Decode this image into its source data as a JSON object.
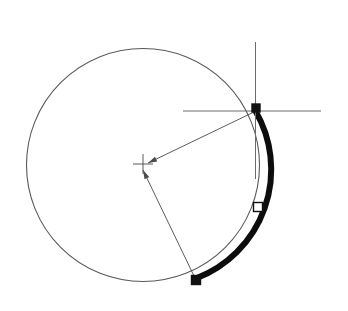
{
  "document": {
    "title": "CAD Arc Selection Diagram",
    "background_color": "#ffffff",
    "width": 348,
    "height": 311
  },
  "style": {
    "geometry_color": "#595959",
    "selection_color": "#0d0d0d",
    "leader_color": "#4a4a4a",
    "crosshair_color": "#6b6b6b",
    "grip_fill_selected": "#111111",
    "grip_fill_hollow": "#ffffff",
    "grip_stroke": "#111111",
    "circle_stroke_width": 1.1,
    "arc_stroke_width": 6,
    "leader_stroke_width": 0.9,
    "crosshair_stroke_width": 1.0
  },
  "geometry": {
    "circle": {
      "label": "base-circle",
      "center_x": 143,
      "center_y": 165,
      "radius": 116.5
    },
    "center_marker": {
      "label": "circle-center-node",
      "x": 143,
      "y": 164,
      "arm_length": 10
    },
    "selected_arc": {
      "label": "highlighted-arc",
      "start_x": 255.5,
      "start_y": 111,
      "end_x": 197,
      "end_y": 278,
      "sweep_large_arc": 0,
      "sweep_direction": 1,
      "path": "M 255.5 111 A 116.5 116.5 0 0 1 197 278"
    },
    "arc_midpoint_grip": {
      "label": "arc-midpoint-grip",
      "x": 258,
      "y": 207,
      "size": 9,
      "filled": false
    },
    "arc_start_grip": {
      "label": "arc-start-grip",
      "x": 256,
      "y": 108,
      "size": 8,
      "filled": true
    },
    "arc_end_grip": {
      "label": "arc-end-grip",
      "x": 196,
      "y": 280,
      "size": 9,
      "filled": true
    },
    "leader_top": {
      "label": "radius-leader-top",
      "x1": 254,
      "y1": 112,
      "x2": 148,
      "y2": 163
    },
    "leader_bottom": {
      "label": "radius-leader-bottom",
      "x1": 194,
      "y1": 276,
      "x2": 143,
      "y2": 170
    },
    "crosshair_cursor": {
      "label": "crosshair-cursor",
      "center_x": 255.5,
      "center_y": 111,
      "vertical_top": 42,
      "vertical_bottom": 179,
      "horizontal_left": 183,
      "horizontal_right": 321
    }
  },
  "annotations": {
    "center_label": "J"
  }
}
